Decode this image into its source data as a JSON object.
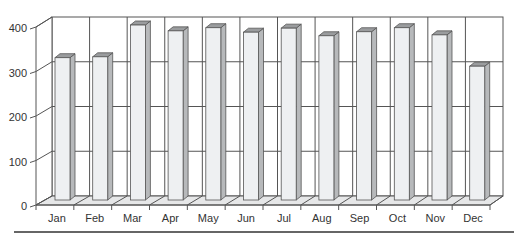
{
  "chart_data": {
    "type": "bar",
    "style": "3d-column",
    "title": "",
    "xlabel": "",
    "ylabel": "",
    "categories": [
      "Jan",
      "Feb",
      "Mar",
      "Apr",
      "May",
      "Jun",
      "Jul",
      "Aug",
      "Sep",
      "Oct",
      "Nov",
      "Dec"
    ],
    "values": [
      318,
      320,
      391,
      378,
      385,
      375,
      384,
      367,
      376,
      385,
      369,
      299
    ],
    "ylim": [
      0,
      400
    ],
    "yticks": [
      0,
      100,
      200,
      300,
      400
    ],
    "ytick_labels": [
      "0",
      "100",
      "200",
      "300",
      "400"
    ],
    "grid": true,
    "legend": "none"
  },
  "colors": {
    "bar_front": "#eef0f2",
    "bar_side": "#b7b9bb",
    "bar_top": "#9a9c9e",
    "bar_outline": "#555555",
    "wall": "#ffffff",
    "floor": "#e6e7e8",
    "grid": "#555555",
    "text": "#333333",
    "rule": "#333333"
  }
}
